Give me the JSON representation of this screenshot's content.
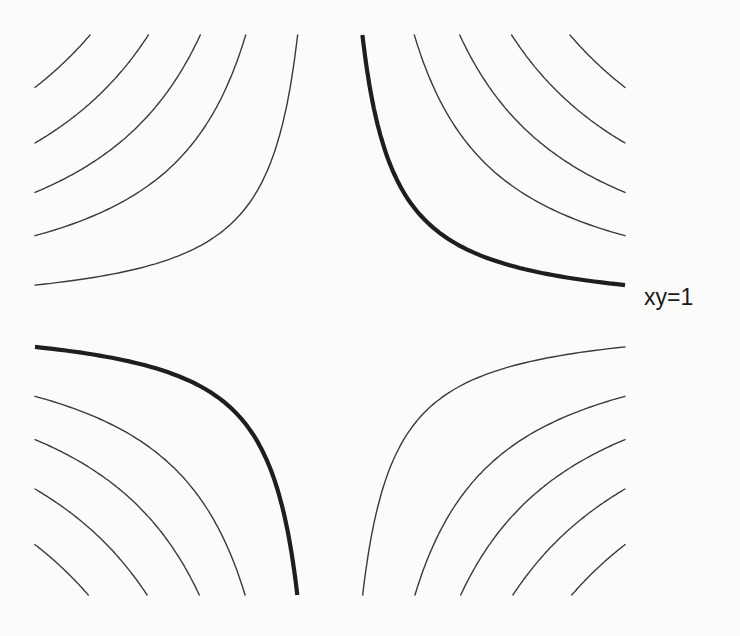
{
  "figure": {
    "label": "xy=1",
    "label_position": {
      "x": 644,
      "y": 284
    },
    "colors": {
      "background": "#fbfbfa",
      "thin_stroke": "#3a3a3a",
      "thick_stroke": "#1e1e1e"
    }
  },
  "chart_data": {
    "type": "contour",
    "title": "",
    "function": "xy",
    "highlighted_level": 1,
    "highlighted_label": "xy=1",
    "levels_positive_quadrants": [
      1,
      2.6,
      4,
      5.6,
      7.4
    ],
    "levels_negative_quadrants": [
      -1,
      -2.6,
      -4,
      -5.6,
      -7.4
    ],
    "thick_curves": [
      {
        "quadrant": "I",
        "level": 1
      },
      {
        "quadrant": "III",
        "level": 1
      }
    ],
    "xlim": [
      -3,
      3
    ],
    "ylim": [
      -3,
      3
    ],
    "axes_shown": false,
    "grid": false,
    "pixel_frame": {
      "cx": 330,
      "cy": 316,
      "sx": 98,
      "sy": 93,
      "left": 35,
      "right": 625,
      "top": 35,
      "bottom": 595
    }
  }
}
